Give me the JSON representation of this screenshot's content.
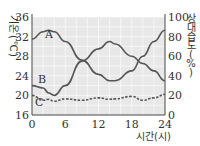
{
  "chart_data": {
    "type": "line",
    "title": "",
    "xlabel": "시간(시)",
    "ylabel_left": "기온(℃)",
    "ylabel_right": "상대 습도(%)",
    "x_ticks": [
      0,
      6,
      12,
      18,
      24
    ],
    "y_left_ticks": [
      16,
      20,
      24,
      28,
      32,
      36
    ],
    "y_right_ticks": [
      0,
      20,
      40,
      60,
      80,
      100
    ],
    "xlim": [
      0,
      24
    ],
    "ylim_left": [
      16,
      36
    ],
    "ylim_right": [
      0,
      100
    ],
    "grid": true,
    "x": [
      0,
      2,
      3,
      4,
      6,
      9,
      12,
      14,
      15,
      18,
      20,
      22,
      24
    ],
    "series": [
      {
        "name": "A",
        "style": "solid",
        "axis": "left",
        "values": [
          31.5,
          33.0,
          33.3,
          33.0,
          31.0,
          27.2,
          24.3,
          23.0,
          23.0,
          25.0,
          28.0,
          31.0,
          33.3
        ]
      },
      {
        "name": "B",
        "style": "solid",
        "axis": "left",
        "values": [
          22.0,
          21.5,
          20.5,
          20.0,
          22.0,
          27.0,
          29.5,
          31.0,
          30.5,
          28.0,
          26.5,
          25.0,
          23.0
        ]
      },
      {
        "name": "C",
        "style": "dashed",
        "axis": "left",
        "values": [
          20.0,
          19.0,
          19.2,
          18.8,
          19.3,
          19.0,
          19.5,
          19.2,
          19.3,
          19.8,
          19.0,
          19.5,
          20.2
        ]
      }
    ]
  },
  "labels": {
    "A": "A",
    "B": "B",
    "C": "C",
    "left_axis_title_chars": [
      "기",
      "온",
      "(",
      "℃",
      ")"
    ],
    "right_axis_title_chars": [
      "상",
      "대",
      "습",
      "도",
      "(",
      "%",
      ")"
    ],
    "x_axis_title": "시간(시)"
  }
}
